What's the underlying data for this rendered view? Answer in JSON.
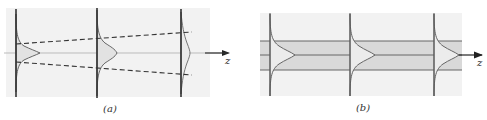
{
  "figure": {
    "panels": [
      {
        "id": "a",
        "caption": "(a)",
        "axis_label": "z",
        "description": "Diverging beam: Gaussian profile spreads as it propagates along z",
        "profile_planes": 3,
        "boundary_style": "dashed, diverging"
      },
      {
        "id": "b",
        "caption": "(b)",
        "axis_label": "z",
        "description": "Guided beam: Gaussian profile keeps constant width within a shaded guiding region",
        "profile_planes": 3,
        "boundary_style": "solid, parallel"
      }
    ],
    "colors": {
      "background_panel": "#f2f2f2",
      "guide_band": "#d9d9d9",
      "profile_fill": "#e4e4e4",
      "line": "#555555",
      "plane": "#333333"
    }
  }
}
